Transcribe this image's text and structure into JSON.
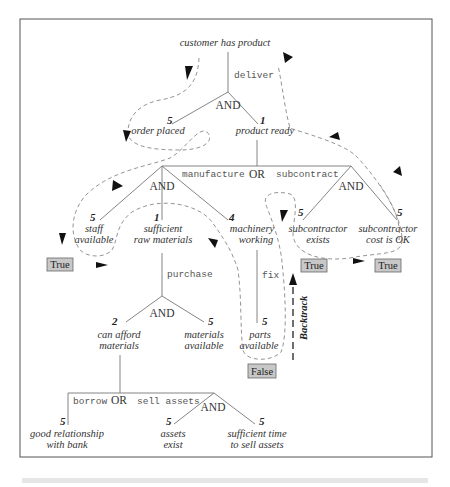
{
  "diagram": {
    "root": {
      "label": "customer has product",
      "action": "deliver",
      "operator": "AND"
    },
    "level1": {
      "order_placed": {
        "label": "order placed",
        "score": "5"
      },
      "product_ready": {
        "label": "product ready",
        "score": "1"
      }
    },
    "product_ready_branch": {
      "operator": "OR",
      "left_action": "manufacture",
      "right_action": "subcontract"
    },
    "manufacture": {
      "operator": "AND",
      "staff_available": {
        "label_line1": "staff",
        "label_line2": "available",
        "score": "5",
        "result": "True"
      },
      "sufficient_raw_materials": {
        "label_line1": "sufficient",
        "label_line2": "raw materials",
        "score": "1",
        "action": "purchase"
      },
      "machinery_working": {
        "label_line1": "machinery",
        "label_line2": "working",
        "score": "4",
        "action": "fix"
      }
    },
    "subcontract": {
      "operator": "AND",
      "subcontractor_exists": {
        "label_line1": "subcontractor",
        "label_line2": "exists",
        "score": "5",
        "result": "True"
      },
      "subcontractor_cost_ok": {
        "label_line1": "subcontractor",
        "label_line2": "cost is OK",
        "score": "5",
        "result": "True"
      }
    },
    "purchase": {
      "operator": "AND",
      "can_afford_materials": {
        "label_line1": "can afford",
        "label_line2": "materials",
        "score": "2"
      },
      "materials_available": {
        "label_line1": "materials",
        "label_line2": "available",
        "score": "5"
      }
    },
    "fix": {
      "parts_available": {
        "label_line1": "parts",
        "label_line2": "available",
        "score": "5",
        "result": "False"
      }
    },
    "afford": {
      "operator": "OR",
      "left_action": "borrow",
      "right_action": "sell assets",
      "good_relationship": {
        "label_line1": "good relationship",
        "label_line2": "with bank",
        "score": "5"
      },
      "sell_assets": {
        "operator": "AND",
        "assets_exist": {
          "label_line1": "assets",
          "label_line2": "exist",
          "score": "5"
        },
        "sufficient_time": {
          "label_line1": "sufficient time",
          "label_line2": "to sell assets",
          "score": "5"
        }
      }
    },
    "backtrack_label": "Backtrack"
  }
}
